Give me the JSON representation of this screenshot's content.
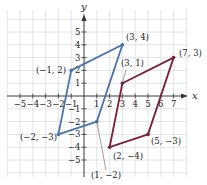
{
  "graph": {
    "origin_px": [
      84,
      96
    ],
    "unit_px": 12.8,
    "grid": {
      "x_min": -6,
      "x_max": 8,
      "y_min": -6,
      "y_max": 6,
      "color": "#d9dde3"
    },
    "axes": {
      "x_label": "x",
      "y_label": "y",
      "color": "#333333",
      "x_ticks": [
        {
          "v": -5,
          "label": "−5"
        },
        {
          "v": -4,
          "label": "−4"
        },
        {
          "v": -3,
          "label": "−3"
        },
        {
          "v": -2,
          "label": "−2"
        },
        {
          "v": -1,
          "label": "−1"
        },
        {
          "v": 1,
          "label": "1"
        },
        {
          "v": 2,
          "label": "2"
        },
        {
          "v": 3,
          "label": "3"
        },
        {
          "v": 4,
          "label": "4"
        },
        {
          "v": 5,
          "label": "5"
        },
        {
          "v": 6,
          "label": "6"
        },
        {
          "v": 7,
          "label": "7"
        }
      ],
      "y_ticks": [
        {
          "v": 5,
          "label": "5"
        },
        {
          "v": 4,
          "label": "4"
        },
        {
          "v": 3,
          "label": "3"
        },
        {
          "v": 2,
          "label": "2"
        },
        {
          "v": 1,
          "label": "1"
        },
        {
          "v": -1,
          "label": "−1"
        },
        {
          "v": -2,
          "label": "−2"
        },
        {
          "v": -3,
          "label": "−3"
        },
        {
          "v": -4,
          "label": "−4"
        },
        {
          "v": -5,
          "label": "−5"
        }
      ]
    },
    "shapes": [
      {
        "name": "blue-parallelogram",
        "color": "#4a72a8",
        "vertices": [
          {
            "x": -1,
            "y": 2,
            "label": "(−1, 2)",
            "lx": 36,
            "ly": 73
          },
          {
            "x": 3,
            "y": 4,
            "label": "(3, 4)",
            "lx": 126,
            "ly": 40
          },
          {
            "x": 1,
            "y": -2,
            "label": "(1, −2)",
            "lx": 91,
            "ly": 178,
            "leader": [
              106,
              170
            ]
          },
          {
            "x": -2,
            "y": -3,
            "label": "(−2, −3)",
            "lx": 20,
            "ly": 140
          }
        ]
      },
      {
        "name": "maroon-parallelogram",
        "color": "#7b1f38",
        "vertices": [
          {
            "x": 3,
            "y": 1,
            "label": "(3, 1)",
            "lx": 121,
            "ly": 66,
            "leader": [
              126,
              70
            ]
          },
          {
            "x": 7,
            "y": 3,
            "label": "(7, 3)",
            "lx": 179,
            "ly": 56
          },
          {
            "x": 5,
            "y": -3,
            "label": "(5, −3)",
            "lx": 151,
            "ly": 144
          },
          {
            "x": 2,
            "y": -4,
            "label": "(2, −4)",
            "lx": 113,
            "ly": 159
          }
        ]
      }
    ]
  }
}
